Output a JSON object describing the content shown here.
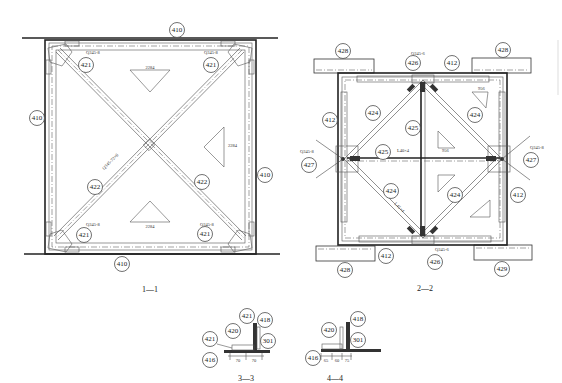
{
  "drawing": {
    "section_1": {
      "title": "1—1",
      "labels": {
        "top": "410",
        "left": "410",
        "right": "410",
        "bottom": "410",
        "tl": "421",
        "tr": "421",
        "bl": "421",
        "br": "421",
        "brace_left": "422",
        "brace_right": "422"
      },
      "tags": {
        "tl": "Q345-8",
        "tr": "Q345-8",
        "bl": "Q345-8",
        "br": "Q345-8",
        "brace": "Q345-72×6"
      },
      "triangle_dims": {
        "long": "2284",
        "short": "1615"
      }
    },
    "section_2": {
      "title": "2—2",
      "labels": {
        "block_tl": "428",
        "block_tr": "428",
        "block_bl": "428",
        "block_br": "429",
        "top": "426",
        "bottom": "426",
        "top_plate": "412",
        "bottom_plate": "412",
        "left_plate": "412",
        "right_plate": "412",
        "left_node": "427",
        "right_node": "427",
        "brace_tl": "424",
        "brace_tr": "424",
        "brace_bl": "424",
        "brace_br": "424",
        "vertical": "425",
        "horizontal": "425"
      },
      "tags": {
        "top": "Q345-6",
        "bottom": "Q345-6",
        "left": "Q345-8",
        "right": "Q345-8",
        "horizontal": "L40×4",
        "brace": "L45×4"
      },
      "triangle_dims": {
        "a": "924",
        "b": "125",
        "c": "956"
      }
    },
    "section_3": {
      "title": "3—3",
      "labels": [
        "421",
        "418",
        "420",
        "301",
        "421",
        "416"
      ],
      "dims": [
        "70",
        "70"
      ]
    },
    "section_4": {
      "title": "4—4",
      "labels": [
        "418",
        "420",
        "301",
        "416"
      ],
      "dims": [
        "65",
        "60",
        "75"
      ]
    }
  }
}
